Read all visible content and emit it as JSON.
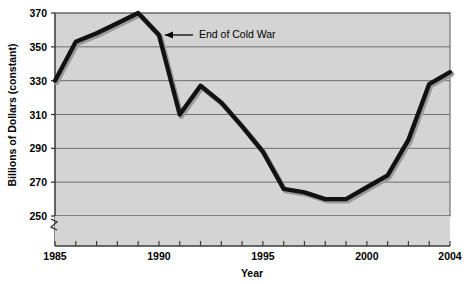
{
  "chart_data": {
    "type": "line",
    "title": "",
    "xlabel": "Year",
    "ylabel": "Billions of Dollars (constant)",
    "xlim": [
      1985,
      2004
    ],
    "ylim": [
      250,
      370
    ],
    "yticks": [
      250,
      270,
      290,
      310,
      330,
      350,
      370
    ],
    "xticks": [
      1985,
      1986,
      1987,
      1988,
      1989,
      1990,
      1991,
      1992,
      1993,
      1994,
      1995,
      1996,
      1997,
      1998,
      1999,
      2000,
      2001,
      2002,
      2003,
      2004
    ],
    "xtick_labels_shown": [
      "1985",
      "1990",
      "1995",
      "2000",
      "2004"
    ],
    "grid": "horizontal",
    "legend": "none",
    "axis_break": true,
    "axis_break_note": "y-axis broken below 250",
    "x": [
      1985,
      1986,
      1987,
      1988,
      1989,
      1990,
      1991,
      1992,
      1993,
      1994,
      1995,
      1996,
      1997,
      1998,
      1999,
      2000,
      2001,
      2002,
      2003,
      2004
    ],
    "values": [
      330,
      353,
      358,
      364,
      370,
      357,
      310,
      327,
      317,
      303,
      288,
      266,
      264,
      260,
      260,
      267,
      274,
      295,
      328,
      335
    ],
    "series": [
      {
        "name": "Defense spending",
        "values": [
          330,
          353,
          358,
          364,
          370,
          357,
          310,
          327,
          317,
          303,
          288,
          266,
          264,
          260,
          260,
          267,
          274,
          295,
          328,
          335
        ]
      }
    ],
    "annotations": [
      {
        "text": "End of Cold War",
        "points_to_year": 1990,
        "points_to_value": 357
      }
    ],
    "colors": {
      "plot_background": "#d4d4d4",
      "line": "#111111",
      "gridline": "#6e6e6e",
      "axis": "#333333",
      "page_background": "#ffffff",
      "shadow": "#9a9a9a"
    }
  }
}
